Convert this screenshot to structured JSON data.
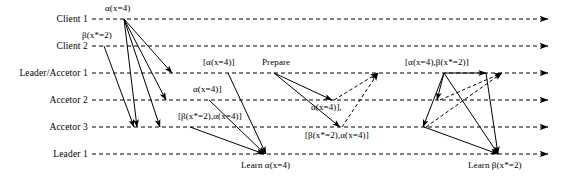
{
  "diagram": {
    "width": 561,
    "height": 192,
    "background_color": "#ffffff",
    "line_color": "#000000",
    "lanes": [
      {
        "id": "client1",
        "label": "Client 1",
        "y": 19,
        "label_x_right": 88,
        "line_start_x": 92,
        "line_end_x": 548
      },
      {
        "id": "client2",
        "label": "Client 2",
        "y": 46,
        "label_x_right": 88,
        "line_start_x": 92,
        "line_end_x": 548
      },
      {
        "id": "leadacc1",
        "label": "Leader/Accetor 1",
        "y": 73,
        "label_x_right": 88,
        "line_start_x": 92,
        "line_end_x": 548
      },
      {
        "id": "acc2",
        "label": "Accetor 2",
        "y": 100,
        "label_x_right": 88,
        "line_start_x": 92,
        "line_end_x": 548
      },
      {
        "id": "acc3",
        "label": "Accetor 3",
        "y": 127,
        "label_x_right": 88,
        "line_start_x": 92,
        "line_end_x": 548
      },
      {
        "id": "leader1",
        "label": "Leader 1",
        "y": 154,
        "label_x_right": 88,
        "line_start_x": 92,
        "line_end_x": 548
      }
    ],
    "messages": [
      {
        "id": "m1",
        "label": "α(x=4)",
        "style": "solid",
        "x1": 124,
        "y1": 19,
        "x2": 172,
        "y2": 73
      },
      {
        "id": "m2",
        "label": "",
        "style": "solid",
        "x1": 124,
        "y1": 19,
        "x2": 166,
        "y2": 100
      },
      {
        "id": "m3",
        "label": "",
        "style": "solid",
        "x1": 124,
        "y1": 19,
        "x2": 160,
        "y2": 127
      },
      {
        "id": "m4",
        "label": "",
        "style": "solid",
        "x1": 124,
        "y1": 19,
        "x2": 137,
        "y2": 127
      },
      {
        "id": "m5",
        "label": "β(x*=2)",
        "style": "solid",
        "x1": 104,
        "y1": 46,
        "x2": 134,
        "y2": 127
      },
      {
        "id": "m6",
        "label": "[α(x=4)]",
        "style": "solid",
        "x1": 228,
        "y1": 73,
        "x2": 266,
        "y2": 154
      },
      {
        "id": "m7",
        "label": "α(x=4)]",
        "style": "solid",
        "x1": 209,
        "y1": 100,
        "x2": 265,
        "y2": 154
      },
      {
        "id": "m8",
        "label": "[β(x*=2),α(x=4)]",
        "style": "solid",
        "x1": 190,
        "y1": 127,
        "x2": 264,
        "y2": 154
      },
      {
        "id": "m9",
        "label": "Prepare",
        "style": "solid",
        "x1": 274,
        "y1": 73,
        "x2": 332,
        "y2": 100
      },
      {
        "id": "m10",
        "label": "",
        "style": "solid",
        "x1": 274,
        "y1": 73,
        "x2": 340,
        "y2": 127
      },
      {
        "id": "m11",
        "label": "α(x=4)],",
        "style": "dashed",
        "x1": 334,
        "y1": 100,
        "x2": 378,
        "y2": 73
      },
      {
        "id": "m12",
        "label": "[β(x*=2),α(x=4)]",
        "style": "dashed",
        "x1": 342,
        "y1": 127,
        "x2": 378,
        "y2": 73
      },
      {
        "id": "m13",
        "label": "[α(x=4),β(x*=2)]",
        "style": "solid",
        "x1": 444,
        "y1": 73,
        "x2": 486,
        "y2": 73
      },
      {
        "id": "m14",
        "label": "",
        "style": "solid",
        "x1": 444,
        "y1": 73,
        "x2": 437,
        "y2": 100
      },
      {
        "id": "m15",
        "label": "",
        "style": "solid",
        "x1": 444,
        "y1": 73,
        "x2": 423,
        "y2": 127
      },
      {
        "id": "m16",
        "label": "",
        "style": "solid",
        "x1": 444,
        "y1": 73,
        "x2": 498,
        "y2": 154
      },
      {
        "id": "m17",
        "label": "",
        "style": "solid",
        "x1": 486,
        "y1": 73,
        "x2": 498,
        "y2": 154
      },
      {
        "id": "m18",
        "label": "",
        "style": "solid",
        "x1": 424,
        "y1": 127,
        "x2": 498,
        "y2": 154
      },
      {
        "id": "m19",
        "label": "",
        "style": "dashed",
        "x1": 426,
        "y1": 127,
        "x2": 502,
        "y2": 73
      },
      {
        "id": "m20",
        "label": "",
        "style": "dashed",
        "x1": 440,
        "y1": 100,
        "x2": 502,
        "y2": 73
      }
    ],
    "annotations": [
      {
        "id": "a1",
        "text": "α(x=4)",
        "x": 105,
        "y": 3,
        "name": "annotation-alpha-client1"
      },
      {
        "id": "a2",
        "text": "β(x*=2)",
        "x": 82,
        "y": 30,
        "name": "annotation-beta-client2"
      },
      {
        "id": "a3",
        "text": "[α(x=4)]",
        "x": 203,
        "y": 57,
        "name": "annotation-alpha-bracket-leadacc1"
      },
      {
        "id": "a4",
        "text": "Prepare",
        "x": 262,
        "y": 57,
        "name": "annotation-prepare"
      },
      {
        "id": "a5",
        "text": "α(x=4)]",
        "x": 193,
        "y": 84,
        "name": "annotation-alpha-acc2"
      },
      {
        "id": "a6",
        "text": "[β(x*=2),α(x=4)]",
        "x": 178,
        "y": 111,
        "name": "annotation-beta-alpha-acc3"
      },
      {
        "id": "a7",
        "text": "α(x=4)],",
        "x": 311,
        "y": 102,
        "name": "annotation-alpha-reply-acc2"
      },
      {
        "id": "a8",
        "text": "[β(x*=2),α(x=4)]",
        "x": 305,
        "y": 130,
        "name": "annotation-beta-alpha-reply-acc3"
      },
      {
        "id": "a9",
        "text": "[α(x=4),β(x*=2)]",
        "x": 405,
        "y": 57,
        "name": "annotation-alpha-beta-accept"
      },
      {
        "id": "a10",
        "text": "Learn α(x=4)",
        "x": 241,
        "y": 160,
        "name": "annotation-learn-alpha"
      },
      {
        "id": "a11",
        "text": "Learn β(x*=2)",
        "x": 468,
        "y": 160,
        "name": "annotation-learn-beta"
      }
    ]
  }
}
